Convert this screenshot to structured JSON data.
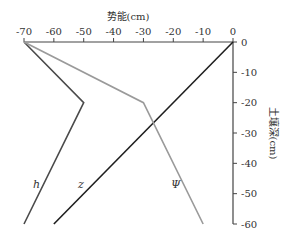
{
  "chart_data": {
    "type": "line",
    "title": "",
    "xlabel": "势能(cm)",
    "ylabel": "土壤深(cm)",
    "x_ticks": [
      -70,
      -60,
      -50,
      -40,
      -30,
      -20,
      -10,
      0
    ],
    "y_ticks": [
      0,
      -10,
      -20,
      -30,
      -40,
      -50,
      -60
    ],
    "xlim": [
      -70,
      0
    ],
    "ylim": [
      -60,
      0
    ],
    "grid": false,
    "legend": "inline labels",
    "series": [
      {
        "name": "h",
        "color": "#4a4a4a",
        "points": [
          [
            -70,
            0
          ],
          [
            -50,
            -20
          ],
          [
            -70,
            -60
          ]
        ]
      },
      {
        "name": "z",
        "color": "#1e1e1e",
        "points": [
          [
            0,
            0
          ],
          [
            -60,
            -60
          ]
        ]
      },
      {
        "name": "Ψ",
        "color": "#9a9a9a",
        "points": [
          [
            -70,
            0
          ],
          [
            -30,
            -20
          ],
          [
            -10,
            -60
          ]
        ]
      }
    ]
  },
  "labels": {
    "xlabel": "势能(cm)",
    "ylabel": "土壤深(cm)",
    "h": "h",
    "z": "z",
    "psi": "Ψ"
  }
}
